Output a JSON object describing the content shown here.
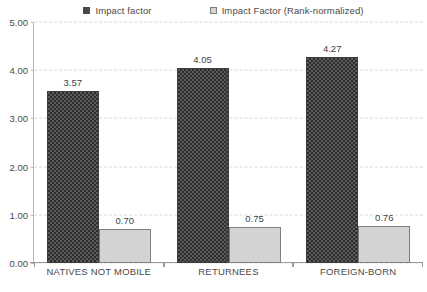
{
  "chart_data": {
    "type": "bar",
    "title": "",
    "subtitle": "",
    "xlabel": "",
    "ylabel": "",
    "categories": [
      "NATIVES NOT MOBILE",
      "RETURNEES",
      "FOREIGN-BORN"
    ],
    "series": [
      {
        "name": "Impact factor",
        "values": [
          3.57,
          4.05,
          4.27
        ],
        "labels": [
          "3.57",
          "4.05",
          "4.27"
        ],
        "color": "#5a5a5a",
        "pattern": "checkerboard-dark"
      },
      {
        "name": "Impact Factor (Rank-normalized)",
        "values": [
          0.7,
          0.75,
          0.76
        ],
        "labels": [
          "0.70",
          "0.75",
          "0.76"
        ],
        "color": "#d3d3d3",
        "pattern": "solid-light"
      }
    ],
    "ylim": [
      0,
      5
    ],
    "y_ticks": [
      0,
      1,
      2,
      3,
      4,
      5
    ],
    "y_tick_labels": [
      "0.00",
      "1.00",
      "2.00",
      "3.00",
      "4.00",
      "5.00"
    ],
    "grid": true,
    "grid_style": "dashed-horizontal",
    "legend_position": "top-center"
  },
  "legend": {
    "entries": [
      {
        "label": "Impact factor",
        "marker": "patterned-square-icon"
      },
      {
        "label": "Impact Factor (Rank-normalized)",
        "marker": "outlined-square-icon"
      }
    ]
  },
  "colors": {
    "series_a": "#5a5a5a",
    "series_b": "#d3d3d3",
    "grid": "#d9d9d9",
    "axis": "#9a9a9a",
    "text": "#4a4a4a",
    "background": "#ffffff"
  }
}
